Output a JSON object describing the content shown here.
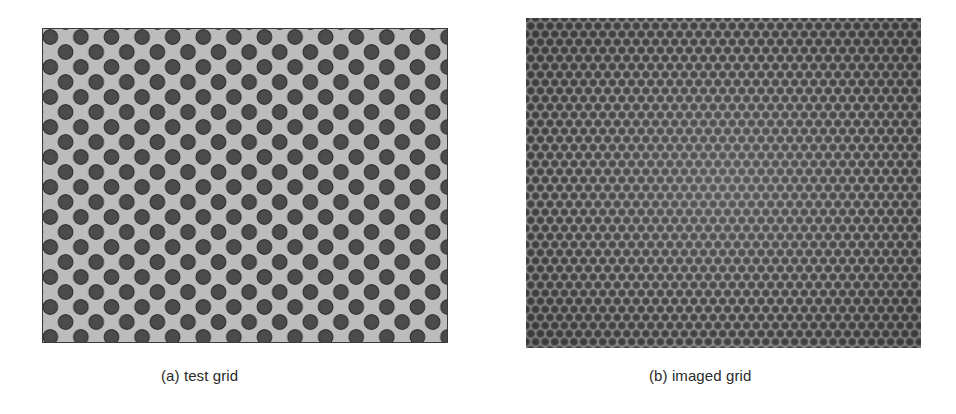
{
  "figure": {
    "panels": [
      {
        "id": "a",
        "label": "(a)",
        "caption": "(a) test grid",
        "content": "hexagonal grid of dark circular dots on light gray background",
        "colors": {
          "background": "#bcbcbc",
          "dot": "#4a4a4a",
          "dot_rim": "#2f2f2f",
          "border": "#3a3a3a"
        }
      },
      {
        "id": "b",
        "label": "(b)",
        "caption": "(b) imaged grid",
        "content": "photographed/imaged fine hexagonal dot grid, blurred, gray",
        "colors": {
          "background": "#9a9a9a",
          "dot": "#474747"
        }
      }
    ]
  }
}
